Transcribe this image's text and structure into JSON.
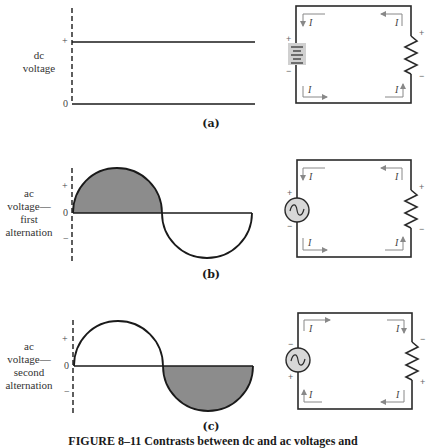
{
  "figure": {
    "caption": "FIGURE 8–11   Contrasts between dc and ac voltages and",
    "colors": {
      "line": "#1a1a1a",
      "shaded_fill": "#8c8c8c",
      "circuit_line": "#2a2a2a",
      "arrow": "#888888",
      "battery_fill": "#d0d0d0",
      "source_fill": "#d8d8d8"
    }
  },
  "panels": [
    {
      "id": "a",
      "panel_label": "(a)",
      "side_label_lines": [
        "dc",
        "voltage"
      ],
      "axis_marks": {
        "plus": "+",
        "zero": "0"
      },
      "waveform": "dc",
      "source_type": "battery",
      "source_polarity": {
        "top": "+",
        "bottom": "−"
      },
      "load_polarity": {
        "top": "+",
        "bottom": "−"
      },
      "current_label": "I",
      "current_direction": "clockwise"
    },
    {
      "id": "b",
      "panel_label": "(b)",
      "side_label_lines": [
        "ac",
        "voltage—",
        "first",
        "alternation"
      ],
      "axis_marks": {
        "plus": "+",
        "zero": "0",
        "minus": "−"
      },
      "waveform": "sine-first-half-shaded",
      "source_type": "ac-source",
      "source_polarity": {
        "top": "+",
        "bottom": "−"
      },
      "load_polarity": {
        "top": "+",
        "bottom": "−"
      },
      "current_label": "I",
      "current_direction": "clockwise"
    },
    {
      "id": "c",
      "panel_label": "(c)",
      "side_label_lines": [
        "ac",
        "voltage—",
        "second",
        "alternation"
      ],
      "axis_marks": {
        "plus": "+",
        "zero": "0",
        "minus": "−"
      },
      "waveform": "sine-second-half-shaded",
      "source_type": "ac-source",
      "source_polarity": {
        "top": "−",
        "bottom": "+"
      },
      "load_polarity": {
        "top": "−",
        "bottom": "+"
      },
      "current_label": "I",
      "current_direction": "counterclockwise"
    }
  ]
}
